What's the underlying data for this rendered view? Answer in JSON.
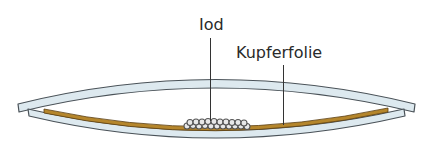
{
  "figure": {
    "labels": {
      "iodine": "Iod",
      "copper_foil": "Kupferfolie"
    },
    "colors": {
      "glass_fill": "#dde9ef",
      "glass_outline": "#4a5258",
      "copper_foil": "#b5862c",
      "copper_outline": "#5a3e10",
      "iodine_crystal": "#6a6a6a",
      "leader_line": "#333333",
      "background": "#ffffff"
    },
    "components": [
      {
        "id": "upper-watch-glass",
        "name": "Uhrglas (oben)"
      },
      {
        "id": "lower-watch-glass",
        "name": "Uhrglas (unten)"
      },
      {
        "id": "copper-foil",
        "name": "Kupferfolie"
      },
      {
        "id": "iodine-crystals",
        "name": "Iod"
      }
    ]
  }
}
